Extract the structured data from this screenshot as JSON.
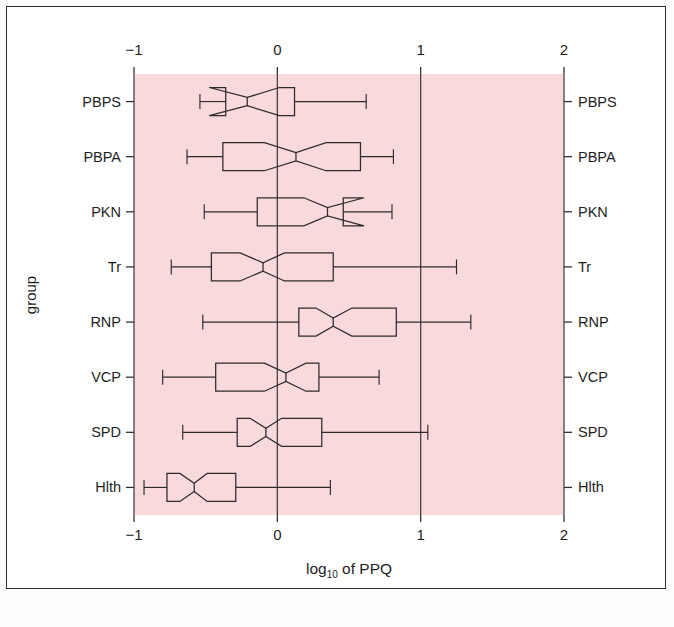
{
  "figure": {
    "background": "#ffffff",
    "panel_color": "#f8d9dc",
    "ink_color": "#2e2a2b"
  },
  "axes": {
    "x_title_pre": "log",
    "x_title_sub": "10",
    "x_title_post": " of PPQ",
    "y_title": "group",
    "x_ticklabels": [
      "−1",
      "0",
      "1",
      "2"
    ],
    "x_tickvalues": [
      -1,
      0,
      1,
      2
    ],
    "y_ticklabels": [
      "PBPS",
      "PBPA",
      "PKN",
      "Tr",
      "RNP",
      "VCP",
      "SPD",
      "Hlth"
    ]
  },
  "chart_data": {
    "type": "box",
    "orientation": "horizontal",
    "title": "",
    "subtitle": "",
    "xlabel": "log10 of PPQ",
    "ylabel": "group",
    "xlim": [
      -1.0,
      2.0
    ],
    "xticks": [
      -1,
      0,
      1,
      2
    ],
    "grid": "vertical white gridlines at each x tick",
    "legend": "none",
    "notched": true,
    "categories": [
      "PBPS",
      "PBPA",
      "PKN",
      "Tr",
      "RNP",
      "VCP",
      "SPD",
      "Hlth"
    ],
    "axis_labels_duplicated_on_right": true,
    "boxes": [
      {
        "group": "PBPS",
        "whisker_low": -0.54,
        "q1": -0.36,
        "median": -0.21,
        "q3": 0.12,
        "whisker_high": 0.62,
        "notch_low": -0.44,
        "notch_high": -0.02,
        "notch_overshoot": true
      },
      {
        "group": "PBPA",
        "whisker_low": -0.63,
        "q1": -0.38,
        "median": 0.13,
        "q3": 0.58,
        "whisker_high": 0.81,
        "notch_low": -0.09,
        "notch_high": 0.34,
        "notch_overshoot": false
      },
      {
        "group": "PKN",
        "whisker_low": -0.51,
        "q1": -0.14,
        "median": 0.35,
        "q3": 0.46,
        "whisker_high": 0.8,
        "notch_low": 0.22,
        "notch_high": 0.57,
        "notch_overshoot": true
      },
      {
        "group": "Tr",
        "whisker_low": -0.74,
        "q1": -0.46,
        "median": -0.1,
        "q3": 0.39,
        "whisker_high": 1.25,
        "notch_low": -0.26,
        "notch_high": 0.05,
        "notch_overshoot": false
      },
      {
        "group": "RNP",
        "whisker_low": -0.52,
        "q1": 0.15,
        "median": 0.39,
        "q3": 0.83,
        "whisker_high": 1.35,
        "notch_low": 0.27,
        "notch_high": 0.52,
        "notch_overshoot": false
      },
      {
        "group": "VCP",
        "whisker_low": -0.8,
        "q1": -0.43,
        "median": 0.06,
        "q3": 0.29,
        "whisker_high": 0.71,
        "notch_low": -0.09,
        "notch_high": 0.2,
        "notch_overshoot": false
      },
      {
        "group": "SPD",
        "whisker_low": -0.66,
        "q1": -0.28,
        "median": -0.08,
        "q3": 0.31,
        "whisker_high": 1.05,
        "notch_low": -0.19,
        "notch_high": 0.03,
        "notch_overshoot": false
      },
      {
        "group": "Hlth",
        "whisker_low": -0.93,
        "q1": -0.77,
        "median": -0.58,
        "q3": -0.29,
        "whisker_high": 0.37,
        "notch_low": -0.68,
        "notch_high": -0.49,
        "notch_overshoot": false
      }
    ]
  }
}
